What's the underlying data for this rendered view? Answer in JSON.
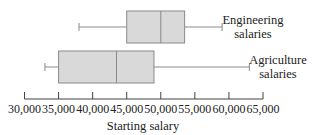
{
  "chart_data": {
    "type": "boxplot",
    "title": "",
    "xlabel": "Starting salary",
    "ylabel": "",
    "xlim": [
      30000,
      65000
    ],
    "x_ticks": [
      30000,
      35000,
      40000,
      45000,
      50000,
      55000,
      60000,
      65000
    ],
    "x_tick_labels": [
      "30,000",
      "35,000",
      "40,000",
      "45,000",
      "50,000",
      "55,000",
      "60,000",
      "65,000"
    ],
    "grid": false,
    "legend": null,
    "series": [
      {
        "name": "Engineering salaries",
        "label_lines": [
          "Engineering",
          "salaries"
        ],
        "min": 38000,
        "q1": 45000,
        "median": 50000,
        "q3": 53500,
        "max": 59000
      },
      {
        "name": "Agriculture salaries",
        "label_lines": [
          "Agriculture",
          "salaries"
        ],
        "min": 33000,
        "q1": 35000,
        "median": 43500,
        "q3": 49000,
        "max": 63000
      }
    ],
    "colors": {
      "box_fill": "#d9d9d9",
      "box_stroke": "#8a8a8a",
      "whisker": "#8a8a8a",
      "axis": "#444444",
      "text": "#222222"
    }
  }
}
